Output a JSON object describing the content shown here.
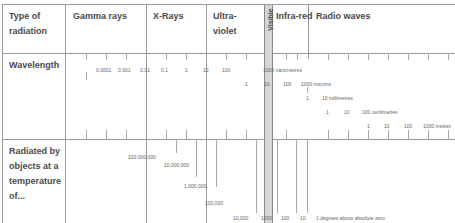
{
  "header": {
    "row_label": "Type of radiation",
    "row_label_line1": "Type of",
    "row_label_line2": "radiation",
    "bands": [
      {
        "label": "Gamma rays"
      },
      {
        "label": "X-Rays"
      },
      {
        "label_line1": "Ultra-",
        "label_line2": "violet"
      },
      {
        "label": "Visible"
      },
      {
        "label": "Infra-red"
      },
      {
        "label": "Radio waves"
      }
    ]
  },
  "wavelength": {
    "label": "Wavelength",
    "scale1": [
      "0.0001",
      "0.001",
      "0.01",
      "0.1",
      "1",
      "10",
      "100",
      "1000 nanometres"
    ],
    "scale2": [
      "1",
      "10",
      "100",
      "1000 microns"
    ],
    "scale3": [
      "1",
      "10 millimetres"
    ],
    "scale4": [
      "1",
      "10",
      "100 centimetres"
    ],
    "scale5": [
      "1",
      "10",
      "100",
      "1000 metres"
    ]
  },
  "temperature": {
    "label_line1": "Radiated by",
    "label_line2": "objects at a",
    "label_line3": "temperature",
    "label_line4": "of...",
    "values": [
      "100,000,000",
      "10,000,000",
      "1,000,000",
      "100,000",
      "10,000",
      "1000",
      "100",
      "10",
      "1 degrees above absolute zero"
    ]
  }
}
